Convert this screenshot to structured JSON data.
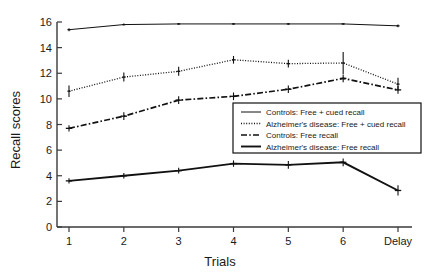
{
  "chart_data": {
    "type": "line",
    "title": "",
    "xlabel": "Trials",
    "ylabel": "Recall scores",
    "categories": [
      "1",
      "2",
      "3",
      "4",
      "5",
      "6",
      "Delay"
    ],
    "x": [
      1,
      2,
      3,
      4,
      5,
      6,
      7
    ],
    "ylim": [
      0,
      16
    ],
    "yticks": [
      0,
      2,
      4,
      6,
      8,
      10,
      12,
      14,
      16
    ],
    "ytick_labels": [
      "0",
      "2",
      "4",
      "6",
      "8",
      "10",
      "12",
      "14",
      "16"
    ],
    "xtick_labels": [
      "1",
      "2",
      "3",
      "4",
      "5",
      "6",
      "Delay"
    ],
    "grid": false,
    "legend_position": "center-right",
    "series": [
      {
        "name": "Controls:  Free + cued recall",
        "style": "solid-thin",
        "marker": "tick",
        "values": [
          15.4,
          15.8,
          15.85,
          15.85,
          15.85,
          15.85,
          15.7
        ],
        "errors": [
          0.12,
          0.08,
          0.06,
          0.06,
          0.06,
          0.06,
          0.1
        ]
      },
      {
        "name": "Alzheimer's disease:  Free + cued recall",
        "style": "dotted",
        "marker": "tick",
        "values": [
          10.6,
          11.7,
          12.15,
          13.05,
          12.75,
          12.8,
          11.15
        ],
        "errors": [
          0.45,
          0.35,
          0.35,
          0.3,
          0.3,
          0.85,
          0.5
        ]
      },
      {
        "name": "Controls:  Free recall",
        "style": "dash-dot",
        "marker": "plus",
        "values": [
          7.7,
          8.65,
          9.9,
          10.2,
          10.75,
          11.6,
          10.7
        ],
        "errors": [
          0.25,
          0.3,
          0.3,
          0.3,
          0.3,
          0.3,
          0.3
        ]
      },
      {
        "name": "Alzheimer's disease:  Free recall",
        "style": "solid-thick",
        "marker": "plus",
        "values": [
          3.6,
          4.0,
          4.4,
          4.95,
          4.85,
          5.05,
          2.85
        ],
        "errors": [
          0.2,
          0.22,
          0.22,
          0.25,
          0.3,
          0.3,
          0.4
        ]
      }
    ]
  },
  "legend": {
    "items": [
      {
        "label": "Controls:  Free + cued recall",
        "swatch": "solid-thin"
      },
      {
        "label": "Alzheimer's disease:  Free + cued recall",
        "swatch": "dotted"
      },
      {
        "label": "Controls:  Free recall",
        "swatch": "dash-dot"
      },
      {
        "label": "Alzheimer's disease:  Free recall",
        "swatch": "solid-thick"
      }
    ]
  },
  "colors": {
    "line": "#111111",
    "axis": "#3a3a3a",
    "text": "#1a1a1a",
    "background": "#ffffff"
  }
}
